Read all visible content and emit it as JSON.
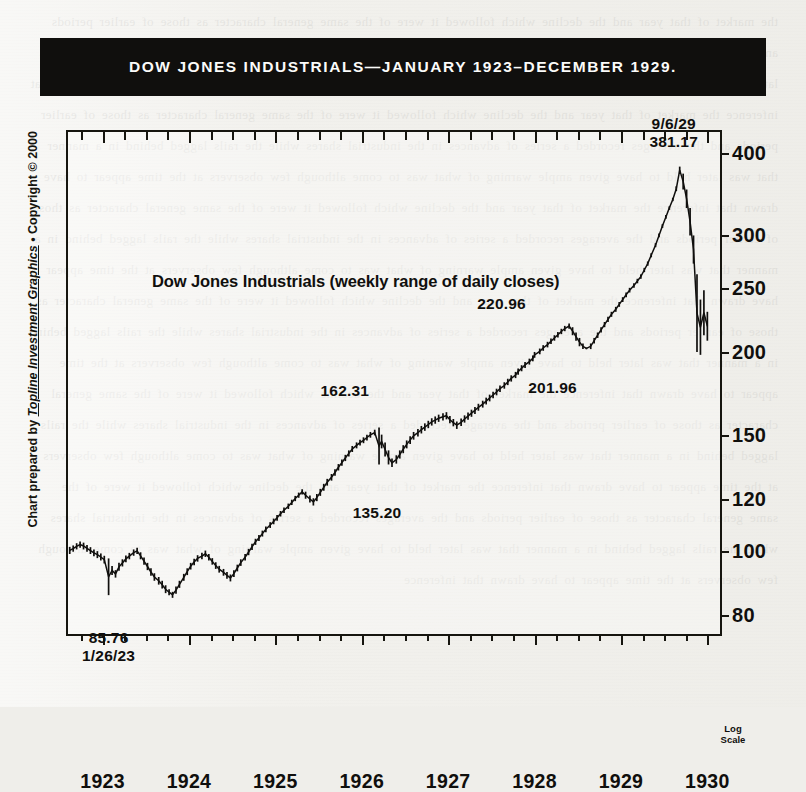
{
  "banner": {
    "title": "DOW JONES INDUSTRIALS—JANUARY 1923–DECEMBER 1929."
  },
  "credit": {
    "prefix": "Chart prepared by ",
    "company": "Topline Investment Graphics",
    "suffix": " • Copyright © 2000"
  },
  "logscale_note": {
    "line1": "Log",
    "line2": "Scale"
  },
  "chart_data": {
    "type": "line",
    "title": "Dow Jones Industrials (weekly range of daily closes)",
    "xlabel": "",
    "ylabel": "",
    "scale": "log",
    "grid": false,
    "legend": "none",
    "ylim": [
      76,
      430
    ],
    "xlim": [
      1922.6,
      1930.1
    ],
    "ytick_values": [
      400,
      300,
      250,
      200,
      150,
      120,
      100,
      80
    ],
    "ytick_labels": [
      "400",
      "300",
      "250",
      "200",
      "150",
      "120",
      "100",
      "80"
    ],
    "xtick_values": [
      1923,
      1924,
      1925,
      1926,
      1927,
      1928,
      1929,
      1930
    ],
    "xtick_labels": [
      "1923",
      "1924",
      "1925",
      "1926",
      "1927",
      "1928",
      "1929",
      "1930"
    ],
    "xtick_minor_step": 0.25,
    "annotations": [
      {
        "name": "low-1923",
        "labels": [
          "85.76",
          "1/26/23"
        ],
        "x": 1923.07,
        "value": 85.76
      },
      {
        "name": "low-1926",
        "labels": [
          "135.20"
        ],
        "x": 1926.2,
        "value": 135.2
      },
      {
        "name": "high-1925",
        "labels": [
          "162.31"
        ],
        "x": 1925.85,
        "value": 162.31
      },
      {
        "name": "low-1928",
        "labels": [
          "201.96"
        ],
        "x": 1928.0,
        "value": 201.96
      },
      {
        "name": "high-1928",
        "labels": [
          "220.96"
        ],
        "x": 1927.78,
        "value": 220.96
      },
      {
        "name": "peak-1929",
        "labels": [
          "9/6/29",
          "381.17"
        ],
        "x": 1929.68,
        "value": 381.17
      }
    ],
    "series": [
      {
        "name": "Dow Jones Industrials weekly range of daily closes",
        "x": [
          1922.62,
          1922.66,
          1922.7,
          1922.74,
          1922.78,
          1922.82,
          1922.86,
          1922.9,
          1922.94,
          1922.98,
          1923.02,
          1923.07,
          1923.11,
          1923.15,
          1923.19,
          1923.23,
          1923.27,
          1923.31,
          1923.36,
          1923.4,
          1923.44,
          1923.48,
          1923.52,
          1923.56,
          1923.6,
          1923.65,
          1923.69,
          1923.73,
          1923.77,
          1923.81,
          1923.85,
          1923.89,
          1923.94,
          1923.98,
          1924.02,
          1924.06,
          1924.1,
          1924.15,
          1924.19,
          1924.23,
          1924.27,
          1924.31,
          1924.35,
          1924.4,
          1924.44,
          1924.48,
          1924.52,
          1924.56,
          1924.6,
          1924.65,
          1924.69,
          1924.73,
          1924.77,
          1924.81,
          1924.85,
          1924.89,
          1924.94,
          1924.98,
          1925.02,
          1925.06,
          1925.1,
          1925.15,
          1925.19,
          1925.23,
          1925.27,
          1925.31,
          1925.35,
          1925.4,
          1925.44,
          1925.48,
          1925.52,
          1925.56,
          1925.6,
          1925.65,
          1925.69,
          1925.73,
          1925.77,
          1925.81,
          1925.85,
          1925.89,
          1925.94,
          1925.98,
          1926.02,
          1926.06,
          1926.1,
          1926.15,
          1926.2,
          1926.23,
          1926.27,
          1926.31,
          1926.35,
          1926.4,
          1926.44,
          1926.48,
          1926.52,
          1926.56,
          1926.6,
          1926.65,
          1926.69,
          1926.73,
          1926.77,
          1926.81,
          1926.85,
          1926.89,
          1926.94,
          1926.98,
          1927.02,
          1927.06,
          1927.1,
          1927.15,
          1927.19,
          1927.23,
          1927.27,
          1927.31,
          1927.35,
          1927.4,
          1927.44,
          1927.48,
          1927.52,
          1927.56,
          1927.6,
          1927.65,
          1927.69,
          1927.73,
          1927.78,
          1927.81,
          1927.85,
          1927.89,
          1927.94,
          1927.98,
          1928.0,
          1928.06,
          1928.1,
          1928.15,
          1928.19,
          1928.23,
          1928.27,
          1928.31,
          1928.35,
          1928.4,
          1928.44,
          1928.48,
          1928.52,
          1928.56,
          1928.6,
          1928.65,
          1928.69,
          1928.73,
          1928.77,
          1928.81,
          1928.85,
          1928.89,
          1928.94,
          1928.98,
          1929.02,
          1929.06,
          1929.1,
          1929.15,
          1929.19,
          1929.23,
          1929.27,
          1929.31,
          1929.35,
          1929.4,
          1929.44,
          1929.48,
          1929.52,
          1929.56,
          1929.6,
          1929.64,
          1929.68,
          1929.72,
          1929.76,
          1929.8,
          1929.84,
          1929.88,
          1929.92,
          1929.96,
          1930.0
        ],
        "high": [
          101.5,
          102.0,
          102.8,
          103.4,
          103.0,
          102.2,
          101.4,
          100.6,
          100.0,
          99.2,
          98.4,
          97.5,
          95.0,
          93.6,
          96.0,
          97.2,
          98.5,
          99.4,
          100.6,
          101.2,
          99.6,
          97.8,
          96.0,
          94.2,
          92.6,
          91.4,
          90.2,
          88.8,
          87.6,
          86.8,
          88.4,
          90.2,
          92.4,
          94.2,
          96.0,
          97.4,
          98.6,
          99.4,
          100.2,
          99.0,
          97.6,
          96.2,
          95.0,
          94.0,
          93.0,
          92.2,
          93.6,
          95.4,
          97.2,
          99.0,
          100.8,
          102.6,
          104.4,
          105.8,
          107.4,
          109.0,
          110.6,
          112.0,
          113.4,
          115.0,
          116.4,
          118.0,
          119.6,
          121.2,
          122.6,
          124.0,
          123.0,
          121.4,
          120.2,
          122.0,
          124.2,
          126.4,
          128.6,
          130.8,
          133.0,
          135.4,
          137.6,
          139.8,
          142.0,
          144.2,
          146.0,
          147.4,
          148.6,
          150.0,
          151.4,
          152.6,
          153.8,
          150.0,
          146.0,
          142.0,
          138.0,
          139.6,
          142.0,
          144.6,
          147.0,
          149.2,
          151.4,
          153.0,
          154.6,
          156.0,
          157.4,
          158.8,
          159.8,
          160.8,
          161.6,
          162.2,
          160.0,
          158.4,
          157.0,
          158.6,
          160.4,
          162.0,
          163.6,
          165.2,
          167.0,
          168.8,
          170.6,
          172.4,
          174.2,
          176.0,
          178.0,
          180.0,
          182.2,
          184.4,
          186.6,
          188.8,
          191.0,
          193.2,
          195.4,
          197.6,
          200.0,
          202.4,
          204.8,
          207.2,
          209.6,
          212.0,
          214.4,
          216.8,
          219.0,
          220.9,
          218.0,
          214.0,
          210.0,
          206.0,
          203.0,
          206.0,
          210.0,
          214.0,
          218.0,
          222.0,
          226.0,
          230.0,
          234.0,
          238.0,
          242.0,
          246.0,
          250.0,
          254.0,
          258.0,
          262.0,
          268.0,
          274.0,
          282.0,
          292.0,
          302.0,
          312.0,
          322.0,
          332.0,
          342.0,
          356.0,
          381.2,
          372.0,
          352.0,
          330.0,
          300.0,
          262.0,
          240.0,
          248.0,
          230.0
        ],
        "low": [
          99.0,
          99.8,
          100.6,
          101.2,
          100.6,
          99.8,
          99.0,
          98.2,
          97.6,
          96.8,
          95.8,
          85.8,
          92.0,
          91.2,
          93.4,
          94.8,
          96.2,
          97.2,
          98.4,
          99.0,
          97.2,
          95.4,
          93.6,
          91.8,
          90.2,
          89.0,
          87.8,
          86.4,
          85.8,
          85.0,
          86.2,
          88.0,
          90.2,
          92.0,
          93.8,
          95.2,
          96.4,
          97.2,
          98.0,
          96.8,
          95.4,
          94.0,
          92.8,
          91.8,
          90.8,
          90.0,
          91.4,
          93.2,
          95.0,
          96.8,
          98.6,
          100.4,
          102.2,
          103.6,
          105.2,
          106.8,
          108.4,
          109.8,
          111.2,
          112.8,
          114.2,
          115.8,
          117.4,
          119.0,
          120.4,
          121.8,
          120.0,
          118.4,
          117.2,
          119.0,
          121.2,
          123.4,
          125.6,
          127.8,
          130.0,
          132.4,
          134.6,
          136.8,
          139.0,
          141.2,
          143.0,
          144.4,
          145.6,
          147.0,
          148.4,
          149.6,
          135.2,
          143.0,
          139.0,
          135.2,
          134.0,
          135.6,
          138.0,
          140.6,
          143.0,
          145.2,
          147.4,
          149.0,
          150.6,
          152.0,
          153.4,
          154.8,
          155.8,
          156.8,
          157.6,
          158.2,
          156.0,
          154.4,
          153.0,
          154.6,
          156.4,
          158.0,
          159.6,
          161.2,
          163.0,
          164.8,
          166.6,
          168.4,
          170.2,
          172.0,
          174.0,
          176.0,
          178.2,
          180.4,
          182.6,
          184.8,
          187.0,
          189.2,
          191.4,
          193.6,
          196.0,
          198.4,
          200.8,
          203.2,
          205.6,
          208.0,
          210.4,
          212.8,
          215.0,
          216.9,
          212.0,
          208.0,
          204.0,
          202.0,
          201.9,
          202.0,
          206.0,
          210.0,
          214.0,
          218.0,
          222.0,
          226.0,
          230.0,
          234.0,
          238.0,
          242.0,
          246.0,
          250.0,
          254.0,
          258.0,
          264.0,
          270.0,
          278.0,
          288.0,
          298.0,
          308.0,
          318.0,
          328.0,
          338.0,
          350.0,
          372.0,
          352.0,
          330.0,
          300.0,
          272.0,
          200.0,
          198.0,
          212.0,
          208.0
        ]
      }
    ]
  }
}
